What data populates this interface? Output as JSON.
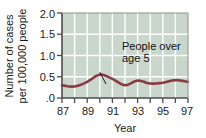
{
  "chart_data": {
    "type": "line",
    "title": "",
    "subtitle": "",
    "xlabel": "Year",
    "ylabel": "Number of cases per 100,000 people",
    "ylabel_line1": "Number of cases",
    "ylabel_line2": "per 100,000 people",
    "xlim": [
      87,
      97
    ],
    "ylim": [
      0,
      2.0
    ],
    "grid": true,
    "legend_position": "none",
    "plot_background": "#c9d6cc",
    "gridline_color": "#ffffff",
    "series_color": "#8b3a42",
    "axis_color": "#4d4d4d",
    "x_tick_labels": [
      "87",
      "89",
      "91",
      "93",
      "95",
      "97"
    ],
    "x_tick_values": [
      87,
      89,
      91,
      93,
      95,
      97
    ],
    "x_minor_values": [
      88,
      90,
      92,
      94,
      96
    ],
    "y_tick_labels": [
      ".0",
      "0.5",
      "1.0",
      "1.5",
      "2.0"
    ],
    "y_tick_values": [
      0.0,
      0.5,
      1.0,
      1.5,
      2.0
    ],
    "series": [
      {
        "name": "People over age 5",
        "x": [
          87,
          88,
          89,
          90,
          91,
          92,
          93,
          94,
          95,
          96,
          97
        ],
        "values": [
          0.3,
          0.27,
          0.38,
          0.55,
          0.45,
          0.3,
          0.41,
          0.34,
          0.36,
          0.42,
          0.38
        ]
      }
    ],
    "annotations": [
      {
        "text_line1": "People over",
        "text_line2": "age 5",
        "text": "People over age 5",
        "points_to_x": 90,
        "points_to_y": 0.55
      }
    ]
  }
}
